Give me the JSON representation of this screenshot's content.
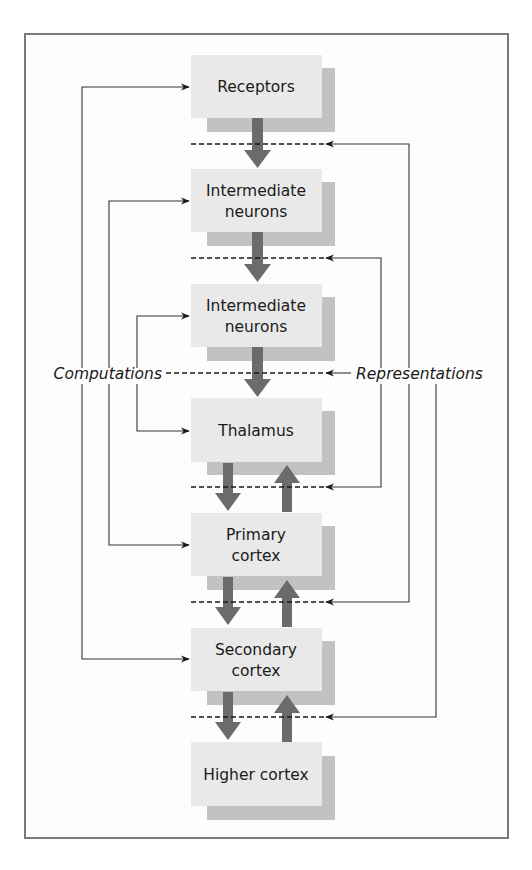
{
  "diagram": {
    "side_labels": {
      "left": "Computations",
      "right": "Representations"
    },
    "boxes": [
      {
        "id": "receptors",
        "lines": [
          "Receptors"
        ]
      },
      {
        "id": "intermediate-neurons-1",
        "lines": [
          "Intermediate",
          "neurons"
        ]
      },
      {
        "id": "intermediate-neurons-2",
        "lines": [
          "Intermediate",
          "neurons"
        ]
      },
      {
        "id": "thalamus",
        "lines": [
          "Thalamus"
        ]
      },
      {
        "id": "primary-cortex",
        "lines": [
          "Primary",
          "cortex"
        ]
      },
      {
        "id": "secondary-cortex",
        "lines": [
          "Secondary",
          "cortex"
        ]
      },
      {
        "id": "higher-cortex",
        "lines": [
          "Higher cortex"
        ]
      }
    ],
    "flow": [
      {
        "from": "receptors",
        "to": "intermediate-neurons-1",
        "direction": "down"
      },
      {
        "from": "intermediate-neurons-1",
        "to": "intermediate-neurons-2",
        "direction": "down"
      },
      {
        "from": "intermediate-neurons-2",
        "to": "thalamus",
        "direction": "down"
      },
      {
        "from": "thalamus",
        "to": "primary-cortex",
        "direction": "bidirectional"
      },
      {
        "from": "primary-cortex",
        "to": "secondary-cortex",
        "direction": "bidirectional"
      },
      {
        "from": "secondary-cortex",
        "to": "higher-cortex",
        "direction": "bidirectional"
      }
    ],
    "computation_links": [
      {
        "from": "receptors",
        "to": "secondary-cortex"
      },
      {
        "from": "intermediate-neurons-1",
        "to": "primary-cortex"
      },
      {
        "from": "intermediate-neurons-2",
        "to": "thalamus"
      }
    ],
    "representation_links": [
      {
        "between": [
          "receptors",
          "intermediate-neurons-1"
        ]
      },
      {
        "between": [
          "intermediate-neurons-1",
          "intermediate-neurons-2"
        ]
      },
      {
        "between": [
          "intermediate-neurons-2",
          "thalamus"
        ]
      },
      {
        "between": [
          "thalamus",
          "primary-cortex"
        ]
      },
      {
        "between": [
          "primary-cortex",
          "secondary-cortex"
        ]
      },
      {
        "between": [
          "secondary-cortex",
          "higher-cortex"
        ]
      }
    ],
    "colors": {
      "box_fill": "#e9e9e9",
      "box_shadow": "#c2c2c2",
      "flow_arrow": "#6b6b6b",
      "line": "#333333",
      "frame": "#7a7a7a"
    }
  }
}
